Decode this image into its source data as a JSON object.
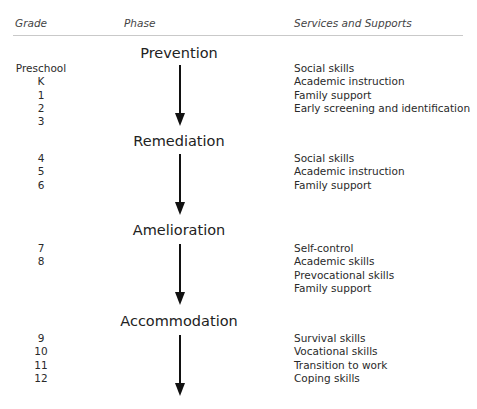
{
  "headers": {
    "grade": "Grade",
    "phase": "Phase",
    "services": "Services and Supports"
  },
  "phases": [
    {
      "name": "Prevention",
      "grades": [
        "Preschool",
        "K",
        "1",
        "2",
        "3"
      ],
      "services": [
        "Social skills",
        "Academic instruction",
        "Family support",
        "Early screening and identification"
      ]
    },
    {
      "name": "Remediation",
      "grades": [
        "4",
        "5",
        "6"
      ],
      "services": [
        "Social skills",
        "Academic instruction",
        "Family support"
      ]
    },
    {
      "name": "Amelioration",
      "grades": [
        "7",
        "8"
      ],
      "services": [
        "Self-control",
        "Academic skills",
        "Prevocational skills",
        "Family support"
      ]
    },
    {
      "name": "Accommodation",
      "grades": [
        "9",
        "10",
        "11",
        "12"
      ],
      "services": [
        "Survival skills",
        "Vocational skills",
        "Transition to work",
        "Coping skills"
      ]
    }
  ]
}
